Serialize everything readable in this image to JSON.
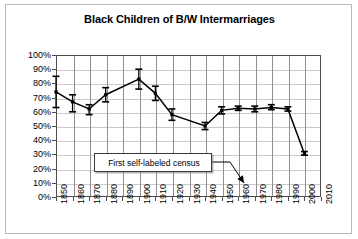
{
  "chart_data": {
    "type": "line",
    "title": "Black Children of B/W Intermarriages",
    "xlabel": "",
    "ylabel": "",
    "xlim": [
      1850,
      2010
    ],
    "ylim": [
      0,
      100
    ],
    "grid": true,
    "legend": "none",
    "x_ticks": [
      "1850",
      "1860",
      "1870",
      "1880",
      "1890",
      "1900",
      "1910",
      "1920",
      "1930",
      "1940",
      "1950",
      "1960",
      "1970",
      "1980",
      "1990",
      "2000",
      "2010"
    ],
    "y_ticks": [
      "0%",
      "10%",
      "20%",
      "30%",
      "40%",
      "50%",
      "60%",
      "70%",
      "80%",
      "90%",
      "100%"
    ],
    "series": [
      {
        "name": "Black children of B/W intermarriages",
        "x": [
          1850,
          1860,
          1870,
          1880,
          1900,
          1910,
          1920,
          1940,
          1950,
          1960,
          1970,
          1980,
          1990,
          2000
        ],
        "values": [
          74,
          67,
          62,
          72,
          83,
          73,
          58,
          50,
          61,
          62.5,
          62,
          63,
          62,
          30.5
        ],
        "error_low": [
          63,
          60,
          58,
          67,
          76,
          68,
          54,
          47.5,
          58.5,
          61,
          60,
          61.5,
          60.5,
          29.5
        ],
        "error_high": [
          85,
          72,
          65,
          77,
          90,
          78,
          62,
          52.5,
          63.5,
          64,
          64,
          65,
          63.5,
          32
        ]
      }
    ],
    "annotations": [
      {
        "id": "first-self-labeled-census",
        "text": "First self-labeled census",
        "arrow": "down-right"
      }
    ],
    "colors": {
      "line": "#000000",
      "grid_horizontal": "#c9c9c9",
      "grid_vertical": "#8f8f8f",
      "axis": "#4d4d4d",
      "background": "#ffffff",
      "border": "#b9b9b9"
    }
  }
}
